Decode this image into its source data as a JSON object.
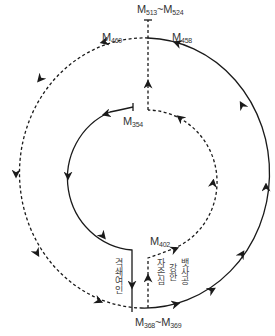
{
  "diagram": {
    "labels": {
      "top": {
        "base": "M",
        "sub1": "513",
        "sep": "~M",
        "sub2": "524"
      },
      "m458": {
        "base": "M",
        "sub": "458"
      },
      "m460": {
        "base": "M",
        "sub": "460"
      },
      "m354": {
        "base": "M",
        "sub": "354"
      },
      "m402": {
        "base": "M",
        "sub": "402"
      },
      "bottom": {
        "base": "M",
        "sub1": "368",
        "sep": "~M",
        "sub2": "369"
      }
    },
    "vertical_texts": {
      "left": "격쇄여인",
      "right_1": "자존심",
      "right_2": "강한",
      "right_3": "뱃사공"
    },
    "colors": {
      "line": "#1a1a1a",
      "text": "#333333"
    }
  }
}
